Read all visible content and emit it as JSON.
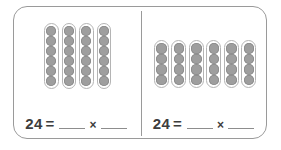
{
  "worksheet": {
    "panels": [
      {
        "name": "left-panel",
        "columns": 4,
        "beads_per_column": 6,
        "equation": {
          "total": "24",
          "equals": "=",
          "times": "×",
          "blank_first": "",
          "blank_second": ""
        }
      },
      {
        "name": "right-panel",
        "columns": 6,
        "beads_per_column": 4,
        "equation": {
          "total": "24",
          "equals": "=",
          "times": "×",
          "blank_first": "",
          "blank_second": ""
        }
      }
    ]
  },
  "colors": {
    "border": "#9a9a9a",
    "rod_outline": "#b4b4b4",
    "bead_fill": "#9e9e9e",
    "text": "#3d3d3d",
    "blank_line": "#8d8d8d",
    "background": "#ffffff"
  }
}
